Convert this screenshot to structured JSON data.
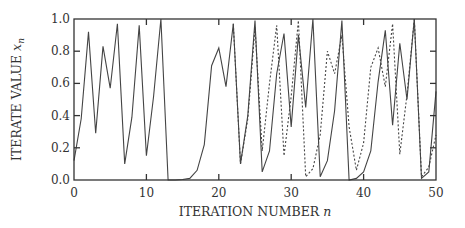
{
  "chart_data": {
    "type": "line",
    "title": "",
    "xlabel": "ITERATION NUMBER n",
    "ylabel": "ITERATE VALUE x_n",
    "xlabel_text": "ITERATION NUMBER ",
    "xlabel_var": "n",
    "ylabel_text": "ITERATE VALUE ",
    "ylabel_var": "x",
    "ylabel_sub": "n",
    "xlim": [
      0,
      50
    ],
    "ylim": [
      0.0,
      1.0
    ],
    "x_ticks": [
      0,
      10,
      20,
      30,
      40,
      50
    ],
    "x_tick_labels": [
      "0",
      "10",
      "20",
      "30",
      "40",
      "50"
    ],
    "y_ticks": [
      0.0,
      0.2,
      0.4,
      0.6,
      0.8,
      1.0
    ],
    "y_tick_labels": [
      "0.0",
      "0.2",
      "0.4",
      "0.6",
      "0.8",
      "1.0"
    ],
    "grid": false,
    "legend": null,
    "series": [
      {
        "name": "trajectory 1 (solid)",
        "style": "solid",
        "color": "#444444",
        "x": [
          0,
          1,
          2,
          3,
          4,
          5,
          6,
          7,
          8,
          9,
          10,
          11,
          12,
          13,
          14,
          15,
          16,
          17,
          18,
          19,
          20,
          21,
          22,
          23,
          24,
          25,
          26,
          27,
          28,
          29,
          30,
          31,
          32,
          33,
          34,
          35,
          36,
          37,
          38,
          39,
          40,
          41,
          42,
          43,
          44,
          45,
          46,
          47,
          48,
          49,
          50
        ],
        "values": [
          0.12,
          0.38,
          0.92,
          0.29,
          0.83,
          0.57,
          0.97,
          0.1,
          0.39,
          0.96,
          0.15,
          0.52,
          1.0,
          0.0,
          0.0,
          0.003,
          0.01,
          0.06,
          0.22,
          0.71,
          0.82,
          0.58,
          0.97,
          0.1,
          0.4,
          0.99,
          0.05,
          0.18,
          0.66,
          0.91,
          0.33,
          0.9,
          0.45,
          1.0,
          0.02,
          0.12,
          0.43,
          0.99,
          0.0,
          0.01,
          0.05,
          0.18,
          0.61,
          0.93,
          0.34,
          0.85,
          0.5,
          1.0,
          0.01,
          0.05,
          0.55
        ]
      },
      {
        "name": "trajectory 2 (dashed)",
        "style": "dashed",
        "color": "#444444",
        "x": [
          22,
          23,
          24,
          25,
          26,
          27,
          28,
          29,
          30,
          31,
          32,
          33,
          34,
          35,
          36,
          37,
          38,
          39,
          40,
          41,
          42,
          43,
          44,
          45,
          46,
          47,
          48,
          49,
          50
        ],
        "values": [
          0.97,
          0.1,
          0.38,
          0.95,
          0.18,
          0.6,
          0.96,
          0.15,
          0.52,
          0.99,
          0.02,
          0.07,
          0.28,
          0.8,
          0.66,
          0.9,
          0.33,
          0.06,
          0.23,
          0.7,
          0.82,
          0.58,
          0.97,
          0.16,
          0.53,
          1.0,
          0.02,
          0.08,
          0.28
        ]
      }
    ]
  }
}
